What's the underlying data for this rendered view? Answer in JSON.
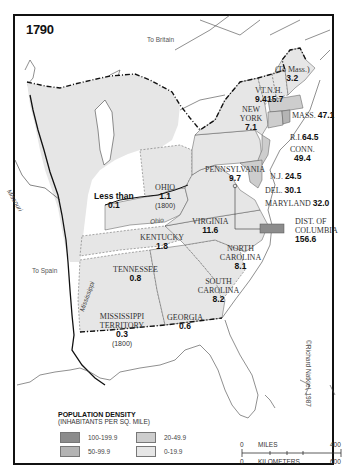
{
  "map": {
    "year": "1790",
    "credit": "©Richard Natkiel, 1987",
    "foreign_labels": {
      "britain": "To Britain",
      "spain": "To Spain"
    },
    "rivers": {
      "missouri": "Missouri",
      "ohio": "Ohio",
      "mississippi": "Mississippi"
    },
    "regions": [
      {
        "name": "(To Mass.)",
        "density": "3.2",
        "note": ""
      },
      {
        "name": "N.H.",
        "density": "15.7",
        "note": ""
      },
      {
        "name": "VT.",
        "density": "9.4",
        "note": ""
      },
      {
        "name": "MASS.",
        "density": "47.1",
        "note": ""
      },
      {
        "name": "R.I.",
        "density": "64.5",
        "note": ""
      },
      {
        "name": "CONN.",
        "density": "49.4",
        "note": ""
      },
      {
        "name": "NEW YORK",
        "density": "7.1",
        "note": ""
      },
      {
        "name": "N.J.",
        "density": "24.5",
        "note": ""
      },
      {
        "name": "DEL.",
        "density": "30.1",
        "note": ""
      },
      {
        "name": "MARYLAND",
        "density": "32.0",
        "note": ""
      },
      {
        "name": "DIST. OF COLUMBIA",
        "density": "156.6",
        "note": ""
      },
      {
        "name": "PENNSYLVANIA",
        "density": "9.7",
        "note": ""
      },
      {
        "name": "VIRGINIA",
        "density": "11.6",
        "note": ""
      },
      {
        "name": "NORTH CAROLINA",
        "density": "8.1",
        "note": ""
      },
      {
        "name": "SOUTH CAROLINA",
        "density": "8.2",
        "note": ""
      },
      {
        "name": "GEORGIA",
        "density": "0.6",
        "note": ""
      },
      {
        "name": "TENNESSEE",
        "density": "0.8",
        "note": ""
      },
      {
        "name": "KENTUCKY",
        "density": "1.8",
        "note": ""
      },
      {
        "name": "OHIO",
        "density": "1.1",
        "note": "(1800)"
      },
      {
        "name": "MISSISSIPPI TERRITORY",
        "density": "0.3",
        "note": "(1800)"
      },
      {
        "name": "Less than",
        "density": "0.1",
        "note": ""
      }
    ],
    "legend": {
      "title": "POPULATION DENSITY",
      "subtitle": "(INHABITANTS PER SQ. MILE)",
      "items": [
        {
          "label": "100-199.9",
          "color": "#8c8c8c"
        },
        {
          "label": "50-99.9",
          "color": "#b4b4b4"
        },
        {
          "label": "20-49.9",
          "color": "#cdcdcd"
        },
        {
          "label": "0-19.9",
          "color": "#e6e6e6"
        }
      ]
    },
    "scale": {
      "miles_label": "MILES",
      "km_label": "KILOMETERS",
      "miles_min": "0",
      "miles_max": "400",
      "km_min": "0",
      "km_max": "600"
    }
  }
}
